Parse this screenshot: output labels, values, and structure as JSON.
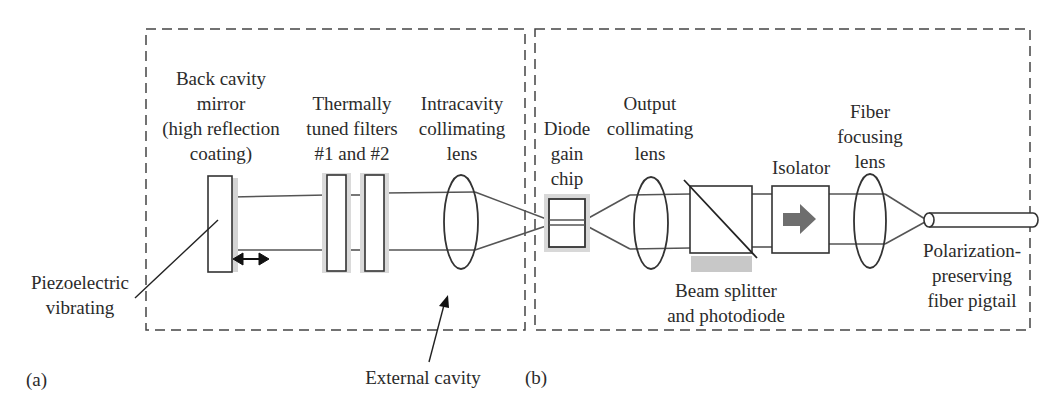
{
  "figure": {
    "panel_a_label": "(a)",
    "panel_b_label": "(b)",
    "colors": {
      "stroke": "#333333",
      "beam": "#555555",
      "dashed_box": "#444444",
      "shadow": "#d4d4d4",
      "photodiode": "#c8c8c8",
      "isolator_arrow": "#6e6e6e"
    }
  },
  "components": {
    "back_mirror": {
      "lines": [
        "Back cavity",
        "mirror",
        "(high reflection",
        "coating)"
      ]
    },
    "filters": {
      "lines": [
        "Thermally",
        "tuned filters",
        "#1 and #2"
      ]
    },
    "intracavity_lens": {
      "lines": [
        "Intracavity",
        "collimating",
        "lens"
      ]
    },
    "gain_chip": {
      "lines": [
        "Diode",
        "gain",
        "chip"
      ]
    },
    "output_lens": {
      "lines": [
        "Output",
        "collimating",
        "lens"
      ]
    },
    "isolator": {
      "lines": [
        "Isolator"
      ]
    },
    "fiber_lens": {
      "lines": [
        "Fiber",
        "focusing",
        "lens"
      ]
    },
    "beam_splitter": {
      "lines": [
        "Beam splitter",
        "and photodiode"
      ]
    },
    "fiber_pigtail": {
      "lines": [
        "Polarization-",
        "preserving",
        "fiber pigtail"
      ]
    },
    "piezo": {
      "lines": [
        "Piezoelectric",
        "vibrating"
      ]
    },
    "external_cavity": {
      "lines": [
        "External cavity"
      ]
    }
  }
}
